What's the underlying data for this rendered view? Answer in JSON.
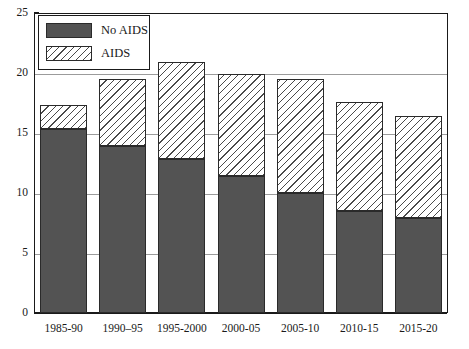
{
  "chart_data": {
    "type": "bar",
    "title": "",
    "subtitle": "",
    "xlabel": "",
    "ylabel": "",
    "stacked": true,
    "grid": true,
    "legend_position": "top-left",
    "categories": [
      "1985-90",
      "1990–95",
      "1995-2000",
      "2000-05",
      "2005-10",
      "2010-15",
      "2015-20"
    ],
    "ylim": [
      0,
      25
    ],
    "yticks": [
      0,
      5,
      10,
      15,
      20,
      25
    ],
    "ytick_labels": [
      "0",
      "5",
      "10",
      "15",
      "20",
      "25"
    ],
    "series": [
      {
        "name": "No AIDS",
        "color": "#535353",
        "fill": "solid",
        "values": [
          15.3,
          13.9,
          12.8,
          11.4,
          10.0,
          8.5,
          7.9
        ]
      },
      {
        "name": "AIDS",
        "color": "#ffffff",
        "fill": "diagonal-hatch",
        "values": [
          2.0,
          5.6,
          8.1,
          8.5,
          9.5,
          9.1,
          8.5
        ]
      }
    ],
    "totals": [
      17.3,
      19.5,
      20.9,
      19.9,
      19.5,
      17.6,
      16.4
    ]
  },
  "legend": {
    "items": [
      {
        "label": "No AIDS",
        "swatch": "solid-dark-gray"
      },
      {
        "label": "AIDS",
        "swatch": "diagonal-hatch"
      }
    ]
  }
}
